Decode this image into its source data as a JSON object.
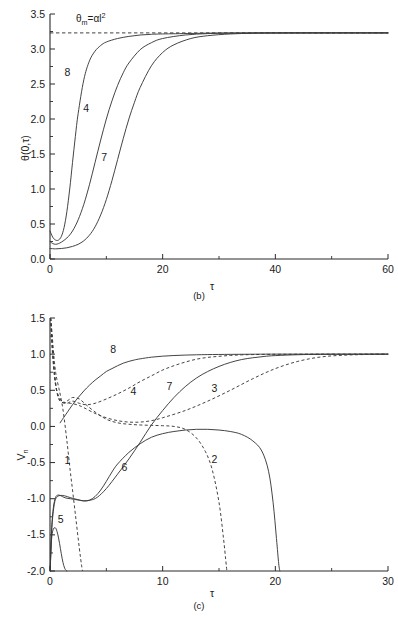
{
  "figure": {
    "caption_b": "(b)",
    "caption_c": "(c)",
    "background_color": "#ffffff",
    "line_color": "#3a3a3a"
  },
  "panel_b": {
    "caption": "(b)",
    "ylabel": "θ(0,τ)",
    "xlabel": "τ",
    "annotation": {
      "base": "θ",
      "subscript": "m",
      "equals": "=αl",
      "superscript": "2",
      "full": "θₘ=αl²"
    },
    "xticks": [
      "0",
      "20",
      "40",
      "60"
    ],
    "xtick_values": [
      0,
      20,
      40,
      60
    ],
    "xminor_values": [
      10,
      30,
      50
    ],
    "yticks": [
      "0.0",
      "0.5",
      "1.0",
      "1.5",
      "2.0",
      "2.5",
      "3.0",
      "3.5"
    ],
    "ytick_values": [
      0.0,
      0.5,
      1.0,
      1.5,
      2.0,
      2.5,
      3.0,
      3.5
    ],
    "yminor_values": [
      0.25,
      0.75,
      1.25,
      1.75,
      2.25,
      2.75,
      3.25
    ],
    "curve_labels": [
      "8",
      "4",
      "7"
    ],
    "asymptote_value": 3.23
  },
  "panel_c": {
    "caption": "(c)",
    "ylabel": "V",
    "ylabel_sub": "n",
    "ylabel_full": "Vₙ",
    "xlabel": "τ",
    "xticks": [
      "0",
      "10",
      "20",
      "30"
    ],
    "xtick_values": [
      0,
      10,
      20,
      30
    ],
    "xminor_values": [
      5,
      15,
      25
    ],
    "yticks": [
      "-2.0",
      "-1.5",
      "-1.0",
      "-0.5",
      "0.0",
      "0.5",
      "1.0",
      "1.5"
    ],
    "ytick_values": [
      -2.0,
      -1.5,
      -1.0,
      -0.5,
      0.0,
      0.5,
      1.0,
      1.5
    ],
    "yminor_values": [
      -1.75,
      -1.25,
      -0.75,
      -0.25,
      0.25,
      0.75,
      1.25
    ],
    "curve_labels": [
      "1",
      "2",
      "3",
      "4",
      "5",
      "6",
      "7",
      "8"
    ]
  },
  "chart_data": [
    {
      "type": "line",
      "panel": "(b)",
      "title": "",
      "xlabel": "τ",
      "ylabel": "θ(0,τ)",
      "xlim": [
        0,
        60
      ],
      "ylim": [
        0.0,
        3.5
      ],
      "grid": false,
      "legend": "inline-curve-labels",
      "annotations": [
        {
          "text": "θₘ=αl²",
          "x": 4.0,
          "y": 3.42
        }
      ],
      "reference_lines": [
        {
          "type": "horizontal",
          "value": 3.23,
          "style": "dashed",
          "label": "θₘ=αl²"
        }
      ],
      "series": [
        {
          "name": "8",
          "style": "solid",
          "label_at": {
            "x": 3.1,
            "y": 2.62
          },
          "x": [
            0,
            0.5,
            1,
            1.5,
            2,
            2.5,
            3,
            3.5,
            4,
            4.5,
            5,
            6,
            7,
            8,
            9,
            10,
            12,
            14,
            16,
            18,
            20,
            25,
            30,
            40,
            50,
            60
          ],
          "y": [
            0.4,
            0.31,
            0.27,
            0.27,
            0.32,
            0.45,
            0.68,
            1.0,
            1.38,
            1.75,
            2.08,
            2.56,
            2.83,
            2.97,
            3.05,
            3.1,
            3.15,
            3.18,
            3.2,
            3.21,
            3.215,
            3.222,
            3.228,
            3.23,
            3.23,
            3.23
          ]
        },
        {
          "name": "4",
          "style": "solid",
          "label_at": {
            "x": 6.4,
            "y": 2.1
          },
          "x": [
            0,
            0.5,
            1,
            1.5,
            2,
            3,
            4,
            5,
            6,
            7,
            8,
            9,
            10,
            11,
            12,
            13,
            14,
            16,
            18,
            20,
            24,
            28,
            32,
            40,
            50,
            60
          ],
          "y": [
            0.25,
            0.22,
            0.21,
            0.22,
            0.24,
            0.3,
            0.4,
            0.56,
            0.78,
            1.06,
            1.38,
            1.7,
            2.0,
            2.26,
            2.48,
            2.66,
            2.8,
            2.99,
            3.09,
            3.15,
            3.2,
            3.22,
            3.226,
            3.23,
            3.23,
            3.23
          ]
        },
        {
          "name": "7",
          "style": "solid",
          "label_at": {
            "x": 9.6,
            "y": 1.4
          },
          "x": [
            0,
            1,
            2,
            3,
            4,
            5,
            6,
            7,
            8,
            9,
            10,
            11,
            12,
            13,
            14,
            15,
            16,
            18,
            20,
            22,
            25,
            28,
            32,
            36,
            40,
            50,
            60
          ],
          "y": [
            0.15,
            0.145,
            0.15,
            0.16,
            0.18,
            0.21,
            0.26,
            0.34,
            0.46,
            0.63,
            0.85,
            1.12,
            1.42,
            1.72,
            2.0,
            2.24,
            2.45,
            2.76,
            2.95,
            3.06,
            3.15,
            3.19,
            3.215,
            3.225,
            3.228,
            3.23,
            3.23
          ]
        }
      ]
    },
    {
      "type": "line",
      "panel": "(c)",
      "title": "",
      "xlabel": "τ",
      "ylabel": "Vₙ",
      "xlim": [
        0,
        30
      ],
      "ylim": [
        -2.0,
        1.5
      ],
      "grid": false,
      "legend": "inline-curve-labels",
      "series": [
        {
          "name": "1",
          "style": "dashed",
          "label_at": {
            "x": 1.55,
            "y": -0.52
          },
          "x": [
            0.05,
            0.1,
            0.2,
            0.3,
            0.4,
            0.5,
            0.6,
            0.8,
            1.0,
            1.2,
            1.5,
            1.8,
            2.0,
            2.3,
            2.6,
            2.8,
            2.9
          ],
          "y": [
            1.5,
            1.45,
            1.25,
            1.05,
            0.88,
            0.75,
            0.66,
            0.52,
            0.37,
            0.18,
            -0.2,
            -0.62,
            -0.88,
            -1.28,
            -1.68,
            -1.92,
            -2.0
          ]
        },
        {
          "name": "2",
          "style": "dashed",
          "label_at": {
            "x": 14.6,
            "y": -0.5
          },
          "x": [
            0.05,
            0.15,
            0.3,
            0.5,
            0.7,
            0.9,
            1.2,
            1.6,
            2.0,
            2.6,
            3.2,
            4.0,
            5.0,
            6.0,
            7.0,
            8.0,
            9.0,
            10.0,
            11.0,
            12.0,
            13.0,
            13.8,
            14.4,
            15.0,
            15.4,
            15.6,
            15.7
          ],
          "y": [
            1.5,
            1.3,
            0.95,
            0.6,
            0.42,
            0.35,
            0.33,
            0.36,
            0.4,
            0.38,
            0.3,
            0.2,
            0.1,
            0.05,
            0.03,
            0.02,
            0.015,
            0.01,
            0.0,
            -0.04,
            -0.16,
            -0.35,
            -0.6,
            -1.05,
            -1.55,
            -1.85,
            -2.0
          ]
        },
        {
          "name": "3",
          "style": "dashed",
          "label_at": {
            "x": 14.6,
            "y": 0.47
          },
          "x": [
            0.05,
            0.2,
            0.4,
            0.6,
            0.9,
            1.3,
            1.8,
            2.4,
            3.0,
            4.0,
            5.0,
            6.0,
            7.0,
            8.0,
            9.0,
            10.0,
            12.0,
            14.0,
            16.0,
            18.0,
            20.0,
            22.0,
            24.0,
            26.0,
            28.0,
            30.0
          ],
          "y": [
            1.5,
            1.1,
            0.72,
            0.5,
            0.38,
            0.33,
            0.32,
            0.3,
            0.26,
            0.18,
            0.12,
            0.08,
            0.06,
            0.06,
            0.08,
            0.12,
            0.22,
            0.35,
            0.5,
            0.66,
            0.8,
            0.9,
            0.96,
            0.985,
            0.995,
            1.0
          ]
        },
        {
          "name": "4",
          "style": "dashed",
          "label_at": {
            "x": 7.4,
            "y": 0.44
          },
          "x": [
            0.05,
            0.2,
            0.4,
            0.6,
            0.8,
            1.1,
            1.5,
            2.0,
            2.6,
            3.2,
            4.0,
            5.0,
            6.0,
            7.0,
            8.0,
            9.0,
            10.0,
            11.0,
            12.0,
            13.0,
            14.0,
            15.0,
            16.0,
            17.0,
            18.0,
            20.0,
            24.0,
            30.0
          ],
          "y": [
            1.5,
            1.05,
            0.68,
            0.48,
            0.38,
            0.33,
            0.32,
            0.35,
            0.32,
            0.3,
            0.32,
            0.38,
            0.45,
            0.53,
            0.62,
            0.7,
            0.78,
            0.84,
            0.89,
            0.93,
            0.955,
            0.97,
            0.982,
            0.99,
            0.994,
            0.998,
            1.0,
            1.0
          ]
        },
        {
          "name": "5",
          "style": "solid",
          "label_at": {
            "x": 0.95,
            "y": -1.33
          },
          "x": [
            0.02,
            0.06,
            0.12,
            0.2,
            0.3,
            0.42,
            0.55,
            0.7,
            0.85,
            1.0,
            1.15,
            1.3,
            1.42,
            1.5
          ],
          "y": [
            -2.0,
            -1.8,
            -1.6,
            -1.48,
            -1.42,
            -1.4,
            -1.42,
            -1.5,
            -1.62,
            -1.76,
            -1.88,
            -1.96,
            -1.99,
            -2.0
          ]
        },
        {
          "name": "6",
          "style": "solid",
          "label_at": {
            "x": 6.6,
            "y": -0.62
          },
          "x": [
            0.02,
            0.08,
            0.15,
            0.3,
            0.5,
            0.7,
            0.9,
            1.1,
            1.4,
            1.8,
            2.2,
            2.6,
            3.0,
            3.5,
            4.0,
            4.5,
            5.0,
            5.5,
            6.0,
            7.0,
            8.0,
            9.0,
            10.0,
            11.0,
            12.0,
            13.0,
            14.0,
            15.0,
            16.0,
            17.0,
            18.0,
            18.8,
            19.4,
            19.8,
            20.1,
            20.3,
            20.4
          ],
          "y": [
            -2.0,
            -1.7,
            -1.4,
            -1.12,
            -0.98,
            -0.95,
            -0.955,
            -0.97,
            -0.99,
            -1.0,
            -1.01,
            -1.02,
            -1.03,
            -1.02,
            -0.97,
            -0.88,
            -0.76,
            -0.63,
            -0.52,
            -0.36,
            -0.24,
            -0.15,
            -0.1,
            -0.07,
            -0.05,
            -0.04,
            -0.04,
            -0.05,
            -0.07,
            -0.11,
            -0.2,
            -0.34,
            -0.62,
            -1.05,
            -1.55,
            -1.9,
            -2.0
          ]
        },
        {
          "name": "7",
          "style": "solid",
          "label_at": {
            "x": 10.6,
            "y": 0.5
          },
          "x": [
            0.02,
            0.08,
            0.2,
            0.4,
            0.6,
            0.9,
            1.3,
            1.8,
            2.4,
            3.0,
            3.6,
            4.2,
            5.0,
            6.0,
            7.0,
            8.0,
            9.0,
            10.0,
            11.0,
            12.0,
            13.0,
            14.0,
            15.0,
            16.0,
            17.0,
            18.0,
            19.0,
            20.0,
            22.0,
            24.0,
            27.0,
            30.0
          ],
          "y": [
            -2.0,
            -1.68,
            -1.32,
            -1.06,
            -0.98,
            -0.955,
            -0.96,
            -0.985,
            -1.01,
            -1.03,
            -1.02,
            -0.98,
            -0.86,
            -0.66,
            -0.45,
            -0.22,
            0.02,
            0.22,
            0.4,
            0.55,
            0.67,
            0.76,
            0.83,
            0.885,
            0.925,
            0.95,
            0.968,
            0.98,
            0.992,
            0.997,
            0.999,
            1.0
          ]
        },
        {
          "name": "8",
          "style": "solid",
          "label_at": {
            "x": 5.6,
            "y": 1.02
          },
          "x": [
            0.9,
            1.2,
            1.6,
            2.0,
            2.5,
            3.0,
            3.5,
            4.0,
            4.5,
            5.0,
            5.5,
            6.0,
            6.5,
            7.0,
            7.5,
            8.0,
            9.0,
            10.0,
            11.0,
            12.0,
            13.0,
            14.0,
            16.0,
            18.0,
            20.0,
            24.0,
            30.0
          ],
          "y": [
            0.05,
            0.12,
            0.21,
            0.3,
            0.4,
            0.49,
            0.57,
            0.64,
            0.7,
            0.76,
            0.8,
            0.84,
            0.875,
            0.9,
            0.92,
            0.935,
            0.958,
            0.972,
            0.981,
            0.987,
            0.991,
            0.994,
            0.997,
            0.999,
            1.0,
            1.0,
            1.0
          ]
        }
      ]
    }
  ]
}
